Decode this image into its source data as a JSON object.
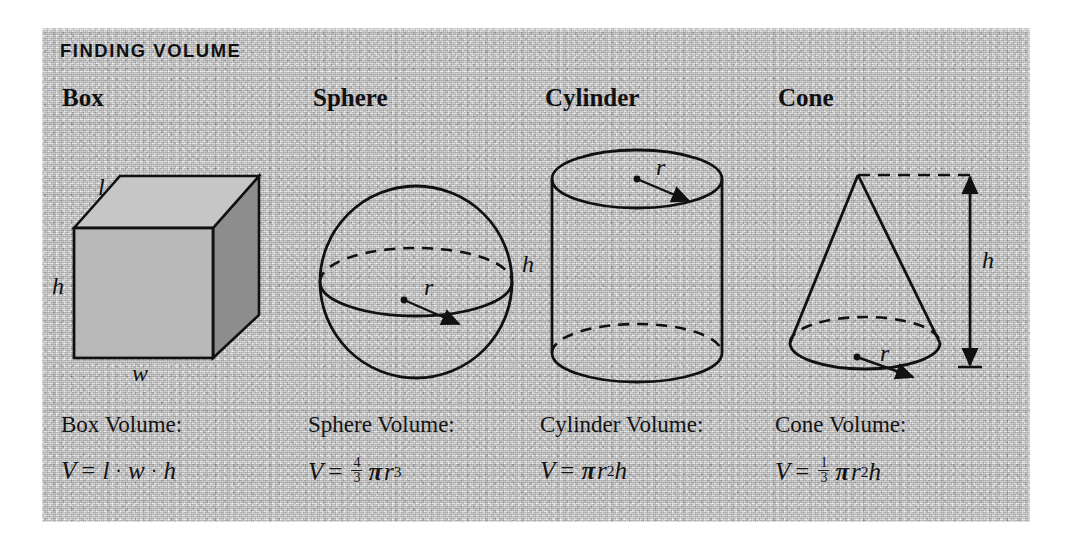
{
  "panel": {
    "title": "FINDING VOLUME",
    "background_color": "#bcbcbc",
    "ink_color": "#111111"
  },
  "columns": [
    {
      "heading": "Box",
      "shape": "box",
      "labels": {
        "l": "l",
        "h": "h",
        "w": "w"
      },
      "caption": "Box Volume:",
      "formula": {
        "lhs": "V",
        "equals": "=",
        "terms": [
          "l",
          "·",
          "w",
          "·",
          "h"
        ],
        "plain": "V = l · w · h"
      }
    },
    {
      "heading": "Sphere",
      "shape": "sphere",
      "labels": {
        "r": "r"
      },
      "caption": "Sphere Volume:",
      "formula": {
        "lhs": "V",
        "equals": "=",
        "fraction": {
          "numerator": "4",
          "denominator": "3"
        },
        "pi": "π",
        "variable": "r",
        "exponent": "3",
        "plain": "V = 4/3 πr³"
      }
    },
    {
      "heading": "Cylinder",
      "shape": "cylinder",
      "labels": {
        "h": "h",
        "r": "r"
      },
      "caption": "Cylinder Volume:",
      "formula": {
        "lhs": "V",
        "equals": "=",
        "pi": "π",
        "variable": "r",
        "exponent": "2",
        "trailing": "h",
        "plain": "V = πr²h"
      }
    },
    {
      "heading": "Cone",
      "shape": "cone",
      "labels": {
        "h": "h",
        "r": "r"
      },
      "caption": "Cone Volume:",
      "formula": {
        "lhs": "V",
        "equals": "=",
        "fraction": {
          "numerator": "1",
          "denominator": "3"
        },
        "pi": "π",
        "variable": "r",
        "exponent": "2",
        "trailing": "h",
        "plain": "V = 1/3 πr²h"
      }
    }
  ]
}
